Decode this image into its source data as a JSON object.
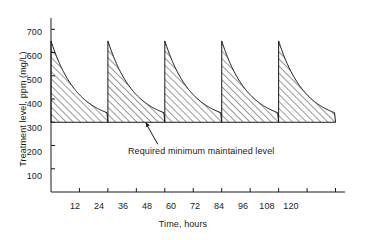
{
  "chart_data": {
    "type": "line",
    "title": "",
    "subtitle": "",
    "xlabel": "Time, hours",
    "ylabel": "Treatment level, ppm (mg/L)",
    "xlim": [
      0,
      124
    ],
    "ylim": [
      0,
      740
    ],
    "xticks": [
      12,
      24,
      36,
      48,
      60,
      72,
      84,
      96,
      108,
      120
    ],
    "yticks": [
      100,
      200,
      300,
      400,
      500,
      600,
      700
    ],
    "grid": false,
    "legend": null,
    "baseline": {
      "value": 300,
      "label": "Required minimum maintained level"
    },
    "annotations": [
      {
        "text": "Required minimum maintained level",
        "points_to_x": 40,
        "points_to_y": 300
      }
    ],
    "series": [
      {
        "name": "Treatment level",
        "description": "Sawtooth: dose injected every 24 h raising level to ~650 ppm, then exponential decay to 300 ppm",
        "fill": "diagonal-hatch",
        "peak_value": 650,
        "trough_value": 300,
        "period_hours": 24,
        "dose_times": [
          0,
          24,
          48,
          72,
          96
        ],
        "cycles": [
          {
            "start_hour": 0,
            "peak": 650,
            "end_hour": 24,
            "end_value": 300
          },
          {
            "start_hour": 24,
            "peak": 650,
            "end_hour": 48,
            "end_value": 300
          },
          {
            "start_hour": 48,
            "peak": 650,
            "end_hour": 72,
            "end_value": 300
          },
          {
            "start_hour": 72,
            "peak": 650,
            "end_hour": 96,
            "end_value": 300
          },
          {
            "start_hour": 96,
            "peak": 650,
            "end_hour": 120,
            "end_value": 300
          }
        ],
        "points": [
          {
            "x": 0,
            "y": 650
          },
          {
            "x": 3,
            "y": 589
          },
          {
            "x": 6,
            "y": 538
          },
          {
            "x": 9,
            "y": 495
          },
          {
            "x": 12,
            "y": 459
          },
          {
            "x": 15,
            "y": 428
          },
          {
            "x": 18,
            "y": 403
          },
          {
            "x": 21,
            "y": 381
          },
          {
            "x": 24,
            "y": 300
          },
          {
            "x": 24,
            "y": 650
          },
          {
            "x": 27,
            "y": 589
          },
          {
            "x": 30,
            "y": 538
          },
          {
            "x": 33,
            "y": 495
          },
          {
            "x": 36,
            "y": 459
          },
          {
            "x": 39,
            "y": 428
          },
          {
            "x": 42,
            "y": 403
          },
          {
            "x": 45,
            "y": 381
          },
          {
            "x": 48,
            "y": 300
          },
          {
            "x": 48,
            "y": 650
          },
          {
            "x": 51,
            "y": 589
          },
          {
            "x": 54,
            "y": 538
          },
          {
            "x": 57,
            "y": 495
          },
          {
            "x": 60,
            "y": 459
          },
          {
            "x": 63,
            "y": 428
          },
          {
            "x": 66,
            "y": 403
          },
          {
            "x": 69,
            "y": 381
          },
          {
            "x": 72,
            "y": 300
          },
          {
            "x": 72,
            "y": 650
          },
          {
            "x": 75,
            "y": 589
          },
          {
            "x": 78,
            "y": 538
          },
          {
            "x": 81,
            "y": 495
          },
          {
            "x": 84,
            "y": 459
          },
          {
            "x": 87,
            "y": 428
          },
          {
            "x": 90,
            "y": 403
          },
          {
            "x": 93,
            "y": 381
          },
          {
            "x": 96,
            "y": 300
          },
          {
            "x": 96,
            "y": 650
          },
          {
            "x": 99,
            "y": 589
          },
          {
            "x": 102,
            "y": 538
          },
          {
            "x": 105,
            "y": 495
          },
          {
            "x": 108,
            "y": 459
          },
          {
            "x": 111,
            "y": 428
          },
          {
            "x": 114,
            "y": 403
          },
          {
            "x": 117,
            "y": 381
          },
          {
            "x": 120,
            "y": 300
          }
        ]
      }
    ]
  },
  "axis": {
    "x_tick_labels": [
      "12",
      "24",
      "36",
      "48",
      "60",
      "72",
      "84",
      "96",
      "108",
      "120"
    ],
    "y_tick_labels": [
      "100",
      "200",
      "300",
      "400",
      "500",
      "600",
      "700"
    ]
  },
  "colors": {
    "line": "#1a1a1a",
    "axis": "#1a1a1a",
    "text": "#1a1a1a",
    "background": "#ffffff"
  }
}
